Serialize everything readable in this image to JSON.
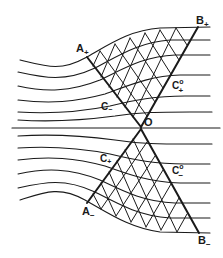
{
  "figure": {
    "type": "characteristics-network diagram (supersonic flow, streamlines with Mach-wave families)",
    "labels": {
      "A_plus": "A",
      "A_plus_sub": "+",
      "B_plus": "B",
      "B_plus_sub": "+",
      "A_minus": "A",
      "A_minus_sub": "−",
      "B_minus": "B",
      "B_minus_sub": "−",
      "O": "O",
      "C_minus_upper": "C",
      "C_minus_upper_sub": "−",
      "C_plus_lower": "C",
      "C_plus_lower_sub": "+",
      "C0_plus": "C",
      "C0_plus_sup": "o",
      "C0_plus_sub": "+",
      "C0_minus": "C",
      "C0_minus_sup": "o",
      "C0_minus_sub": "−"
    },
    "colors": {
      "ink": "#1a1a1a",
      "background": "#ffffff"
    }
  }
}
